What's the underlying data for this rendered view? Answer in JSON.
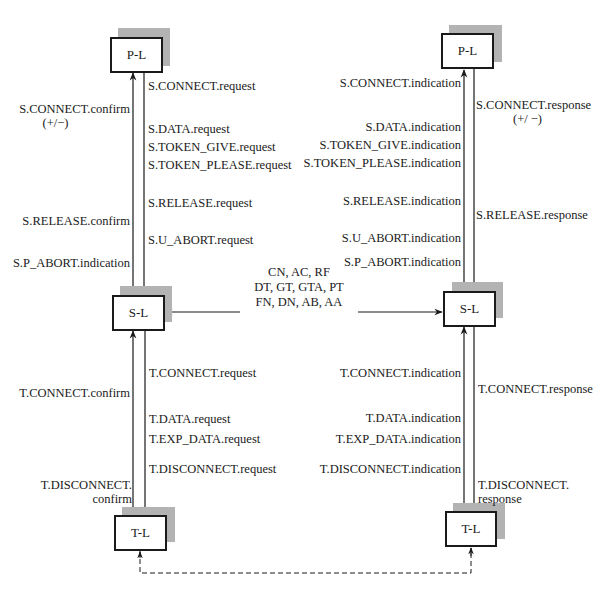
{
  "diagram": {
    "title": "",
    "colors": {
      "line": "#1a1a1a",
      "shadow": "#b3b3b3",
      "box_fill": "#ffffff",
      "background": "#ffffff"
    },
    "left_stack": {
      "presentation": {
        "label": "P-L"
      },
      "session": {
        "label": "S-L"
      },
      "transport": {
        "label": "T-L"
      }
    },
    "right_stack": {
      "presentation": {
        "label": "P-L"
      },
      "session": {
        "label": "S-L"
      },
      "transport": {
        "label": "T-L"
      }
    },
    "left_session_primitives": {
      "upward": [
        {
          "text": "S.CONNECT.confirm",
          "sub": "(+/−)"
        },
        {
          "text": "S.RELEASE.confirm"
        },
        {
          "text": "S.P_ABORT.indication"
        }
      ],
      "downward": [
        {
          "text": "S.CONNECT.request"
        },
        {
          "text": "S.DATA.request"
        },
        {
          "text": "S.TOKEN_GIVE.request"
        },
        {
          "text": "S.TOKEN_PLEASE.request"
        },
        {
          "text": "S.RELEASE.request"
        },
        {
          "text": "S.U_ABORT.request"
        }
      ]
    },
    "right_session_primitives": {
      "upward": [
        {
          "text": "S.CONNECT.indication"
        },
        {
          "text": "S.DATA.indication"
        },
        {
          "text": "S.TOKEN_GIVE.indication"
        },
        {
          "text": "S.TOKEN_PLEASE.indication"
        },
        {
          "text": "S.RELEASE.indication"
        },
        {
          "text": "S.U_ABORT.indication"
        },
        {
          "text": "S.P_ABORT.indication"
        }
      ],
      "downward": [
        {
          "text": "S.CONNECT.response",
          "sub": "(+/ −)"
        },
        {
          "text": "S.RELEASE.response"
        }
      ]
    },
    "session_pdus": {
      "line1": "CN, AC, RF",
      "line2": "DT, GT, GTA, PT",
      "line3": "FN, DN, AB, AA"
    },
    "left_transport_primitives": {
      "upward": [
        {
          "text": "T.CONNECT.confirm"
        },
        {
          "text": "T.DISCONNECT.",
          "sub": "confirm"
        }
      ],
      "downward": [
        {
          "text": "T.CONNECT.request"
        },
        {
          "text": "T.DATA.request"
        },
        {
          "text": "T.EXP_DATA.request"
        },
        {
          "text": "T.DISCONNECT.request"
        }
      ]
    },
    "right_transport_primitives": {
      "upward": [
        {
          "text": "T.CONNECT.indication"
        },
        {
          "text": "T.DATA.indication"
        },
        {
          "text": "T.EXP_DATA.indication"
        },
        {
          "text": "T.DISCONNECT.indication"
        }
      ],
      "downward": [
        {
          "text": "T.CONNECT.response"
        },
        {
          "text": "T.DISCONNECT.",
          "sub": "response"
        }
      ]
    }
  }
}
